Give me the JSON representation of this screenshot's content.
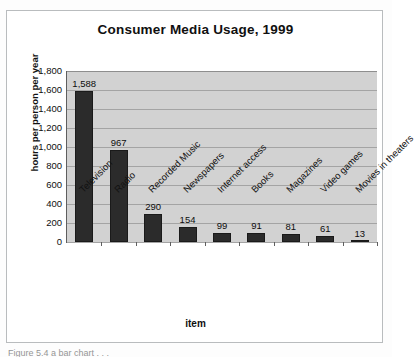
{
  "figure": {
    "caption": "Figure 5.4   a bar chart . . .",
    "x_axis_title": "item",
    "y_axis_title": "hours per person per year"
  },
  "chart_data": {
    "type": "bar",
    "title": "Consumer Media Usage, 1999",
    "xlabel": "item",
    "ylabel": "hours per person per year",
    "ylim": [
      0,
      1800
    ],
    "ytick_step": 200,
    "grid": true,
    "legend": "none",
    "bar_color": "#2b2b2b",
    "plot_background": "#d2d2d2",
    "gridline_color": "#a4a4a4",
    "categories": [
      "Television",
      "Radio",
      "Recorded Music",
      "Newspapers",
      "Internet access",
      "Books",
      "Magazines",
      "Video games",
      "Movies in theaters"
    ],
    "values": [
      1588,
      967,
      290,
      154,
      99,
      91,
      81,
      61,
      13
    ],
    "value_labels": [
      "1,588",
      "967",
      "290",
      "154",
      "99",
      "91",
      "81",
      "61",
      "13"
    ],
    "ytick_labels": [
      "1,800",
      "1,600",
      "1,400",
      "1,200",
      "1,000",
      "800",
      "600",
      "400",
      "200",
      "0"
    ],
    "ytick_values": [
      1800,
      1600,
      1400,
      1200,
      1000,
      800,
      600,
      400,
      200,
      0
    ]
  }
}
